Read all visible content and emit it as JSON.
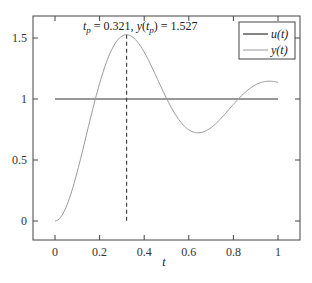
{
  "chart_data": {
    "type": "line",
    "title": "",
    "xlabel": "t",
    "ylabel": "",
    "xlim": [
      -0.1,
      1.1
    ],
    "ylim": [
      -0.15,
      1.68
    ],
    "xticks": [
      0,
      0.2,
      0.4,
      0.6,
      0.8,
      1
    ],
    "xtick_labels": [
      "0",
      "0.2",
      "0.4",
      "0.6",
      "0.8",
      "1"
    ],
    "yticks": [
      0,
      0.5,
      1,
      1.5
    ],
    "ytick_labels": [
      "0",
      "0.5",
      "1",
      "1.5"
    ],
    "grid": false,
    "legend_position": "upper right",
    "series": [
      {
        "name": "u(t)",
        "color": "#333333",
        "style": "solid",
        "x": [
          0,
          1
        ],
        "values": [
          1,
          1
        ]
      },
      {
        "name": "y(t)",
        "color": "#9a9a9a",
        "style": "solid",
        "model": "second-order step response, zeta=0.2, wn=10",
        "x": [
          0,
          0.05,
          0.1,
          0.15,
          0.2,
          0.25,
          0.3,
          0.321,
          0.35,
          0.4,
          0.45,
          0.5,
          0.55,
          0.6,
          0.642,
          0.7,
          0.75,
          0.8,
          0.85,
          0.9,
          0.95,
          1.0
        ],
        "values": [
          0,
          0.11,
          0.38,
          0.72,
          1.04,
          1.31,
          1.49,
          1.527,
          1.5,
          1.4,
          1.23,
          1.04,
          0.87,
          0.76,
          0.723,
          0.76,
          0.84,
          0.94,
          1.04,
          1.11,
          1.14,
          1.136
        ]
      }
    ],
    "annotations": [
      {
        "type": "vline",
        "style": "dashed",
        "x": 0.321,
        "y_range": [
          0,
          1.527
        ]
      },
      {
        "type": "text",
        "text": "t_p = 0.321, y(t_p) = 1.527",
        "x": 0.321,
        "y": 1.6
      }
    ]
  },
  "labels": {
    "xlabel": "t",
    "legend_u": "u(t)",
    "legend_y": "y(t)",
    "ann_tp_sym": "t",
    "ann_tp_sub": "p",
    "ann_tp_val": " = 0.321, ",
    "ann_y_sym": "y",
    "ann_open": "(",
    "ann_y_sub_t": "t",
    "ann_y_sub_p": "p",
    "ann_close": ")",
    "ann_y_val": " = 1.527"
  }
}
